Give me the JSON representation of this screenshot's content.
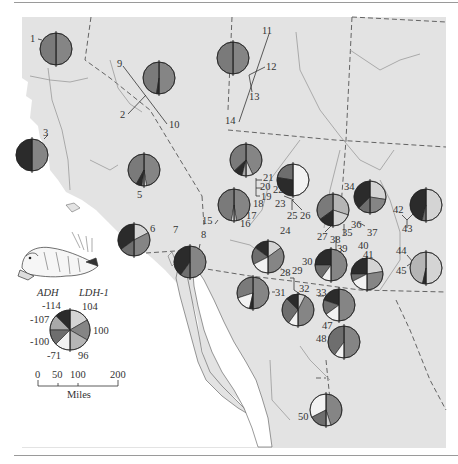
{
  "figure": {
    "type": "allele-frequency pie map",
    "background_land": "#e3e3e3",
    "background_sea": "#ffffff",
    "border_color": "#555555",
    "river_color": "#9a9a9a"
  },
  "legend": {
    "left_header": "ADH",
    "right_header": "LDH-1",
    "adh_alleles": [
      "-114",
      "-107",
      "-100",
      "-71"
    ],
    "ldh_alleles": [
      "104",
      "100",
      "96"
    ],
    "colors": {
      "adh_-114": "#2b2b2b",
      "adh_-107": "#a9a9a9",
      "adh_-100": "#6e6e6e",
      "adh_-71": "#f2f2f2",
      "ldh_104": "#d4d4d4",
      "ldh_100": "#858585",
      "ldh_96": "#b5b5b5"
    }
  },
  "scale_bar": {
    "ticks": [
      "0",
      "50",
      "100",
      "200"
    ],
    "unit": "Miles"
  },
  "illustration": "pocket gopher drawing",
  "sites": [
    {
      "id": "1",
      "x": 56,
      "y": 48
    },
    {
      "id": "2",
      "x": 124,
      "y": 114
    },
    {
      "id": "3",
      "x": 32,
      "y": 155
    },
    {
      "id": "4",
      "x": 32,
      "y": 155
    },
    {
      "id": "5",
      "x": 144,
      "y": 170
    },
    {
      "id": "6",
      "x": 134,
      "y": 247
    },
    {
      "id": "7",
      "x": 76,
      "y": 258
    },
    {
      "id": "8",
      "x": 191,
      "y": 258
    },
    {
      "id": "9",
      "x": 121,
      "y": 67
    },
    {
      "id": "10",
      "x": 173,
      "y": 124
    },
    {
      "id": "11",
      "x": 264,
      "y": 33
    },
    {
      "id": "12",
      "x": 270,
      "y": 66
    },
    {
      "id": "13",
      "x": 252,
      "y": 97
    },
    {
      "id": "14",
      "x": 233,
      "y": 120
    },
    {
      "id": "15",
      "x": 205,
      "y": 218
    },
    {
      "id": "16",
      "x": 244,
      "y": 226
    },
    {
      "id": "17",
      "x": 251,
      "y": 216
    },
    {
      "id": "18",
      "x": 254,
      "y": 203
    },
    {
      "id": "19",
      "x": 264,
      "y": 197
    },
    {
      "id": "20",
      "x": 264,
      "y": 188
    },
    {
      "id": "21",
      "x": 270,
      "y": 178
    },
    {
      "id": "22",
      "x": 284,
      "y": 192
    },
    {
      "id": "23",
      "x": 283,
      "y": 205
    },
    {
      "id": "24",
      "x": 282,
      "y": 231
    },
    {
      "id": "25",
      "x": 290,
      "y": 215
    },
    {
      "id": "26",
      "x": 306,
      "y": 215
    },
    {
      "id": "27",
      "x": 321,
      "y": 238
    },
    {
      "id": "28",
      "x": 281,
      "y": 272
    },
    {
      "id": "29",
      "x": 296,
      "y": 271
    },
    {
      "id": "30",
      "x": 309,
      "y": 262
    },
    {
      "id": "31",
      "x": 280,
      "y": 291
    },
    {
      "id": "32",
      "x": 301,
      "y": 289
    },
    {
      "id": "33",
      "x": 320,
      "y": 289
    },
    {
      "id": "34",
      "x": 350,
      "y": 187
    },
    {
      "id": "35",
      "x": 347,
      "y": 231
    },
    {
      "id": "36",
      "x": 357,
      "y": 225
    },
    {
      "id": "37",
      "x": 371,
      "y": 232
    },
    {
      "id": "38",
      "x": 332,
      "y": 241
    },
    {
      "id": "39",
      "x": 342,
      "y": 250
    },
    {
      "id": "40",
      "x": 358,
      "y": 246
    },
    {
      "id": "41",
      "x": 364,
      "y": 256
    },
    {
      "id": "42",
      "x": 398,
      "y": 210
    },
    {
      "id": "43",
      "x": 407,
      "y": 228
    },
    {
      "id": "44",
      "x": 402,
      "y": 251
    },
    {
      "id": "45",
      "x": 402,
      "y": 270
    },
    {
      "id": "47",
      "x": 326,
      "y": 328
    },
    {
      "id": "48",
      "x": 320,
      "y": 341
    },
    {
      "id": "50",
      "x": 305,
      "y": 418
    }
  ],
  "pies": [
    {
      "site": "1",
      "cx": 56,
      "cy": 49,
      "r": 16,
      "left": [
        [
          "#7a7a7a",
          1.0
        ]
      ],
      "right": [
        [
          "#858585",
          1.0
        ]
      ]
    },
    {
      "site": "9/10",
      "cx": 159,
      "cy": 78,
      "r": 16,
      "left": [
        [
          "#7a7a7a",
          0.95
        ],
        [
          "#2b2b2b",
          0.05
        ]
      ],
      "right": [
        [
          "#858585",
          1.0
        ]
      ]
    },
    {
      "site": "11-14",
      "cx": 233,
      "cy": 58,
      "r": 16,
      "left": [
        [
          "#7a7a7a",
          1.0
        ]
      ],
      "right": [
        [
          "#858585",
          1.0
        ]
      ]
    },
    {
      "site": "3",
      "cx": 32,
      "cy": 155,
      "r": 16,
      "left": [
        [
          "#2b2b2b",
          1.0
        ]
      ],
      "right": [
        [
          "#858585",
          1.0
        ]
      ]
    },
    {
      "site": "5",
      "cx": 144,
      "cy": 170,
      "r": 16,
      "left": [
        [
          "#7a7a7a",
          0.84
        ],
        [
          "#2b2b2b",
          0.12
        ],
        [
          "#a9a9a9",
          0.04
        ]
      ],
      "right": [
        [
          "#858585",
          0.95
        ],
        [
          "#f2f2f2",
          0.05
        ]
      ]
    },
    {
      "site": "15-17",
      "cx": 234,
      "cy": 205,
      "r": 16,
      "left": [
        [
          "#7a7a7a",
          0.95
        ],
        [
          "#f2f2f2",
          0.05
        ]
      ],
      "right": [
        [
          "#858585",
          0.95
        ],
        [
          "#d4d4d4",
          0.05
        ]
      ]
    },
    {
      "site": "18-21",
      "cx": 246,
      "cy": 160,
      "r": 16,
      "left": [
        [
          "#7a7a7a",
          0.74
        ],
        [
          "#2b2b2b",
          0.18
        ],
        [
          "#a9a9a9",
          0.08
        ]
      ],
      "right": [
        [
          "#858585",
          0.86
        ],
        [
          "#d4d4d4",
          0.14
        ]
      ]
    },
    {
      "site": "22-26",
      "cx": 293,
      "cy": 180,
      "r": 16,
      "left": [
        [
          "#6e6e6e",
          0.45
        ],
        [
          "#2b2b2b",
          0.55
        ]
      ],
      "right": [
        [
          "#f2f2f2",
          1.0
        ]
      ]
    },
    {
      "site": "6",
      "cx": 134,
      "cy": 240,
      "r": 16,
      "left": [
        [
          "#2b2b2b",
          0.7
        ],
        [
          "#6e6e6e",
          0.3
        ]
      ],
      "right": [
        [
          "#d4d4d4",
          0.35
        ],
        [
          "#858585",
          0.65
        ]
      ]
    },
    {
      "site": "8",
      "cx": 190,
      "cy": 262,
      "r": 16,
      "left": [
        [
          "#2b2b2b",
          0.8
        ],
        [
          "#6e6e6e",
          0.2
        ]
      ],
      "right": [
        [
          "#858585",
          1.0
        ]
      ]
    },
    {
      "site": "24",
      "cx": 268,
      "cy": 257,
      "r": 16,
      "left": [
        [
          "#2b2b2b",
          0.3
        ],
        [
          "#6e6e6e",
          0.35
        ],
        [
          "#f2f2f2",
          0.35
        ]
      ],
      "right": [
        [
          "#d4d4d4",
          0.3
        ],
        [
          "#858585",
          0.7
        ]
      ]
    },
    {
      "site": "27/35",
      "cx": 333,
      "cy": 210,
      "r": 16,
      "left": [
        [
          "#7a7a7a",
          0.7
        ],
        [
          "#2b2b2b",
          0.3
        ]
      ],
      "right": [
        [
          "#b5b5b5",
          0.6
        ],
        [
          "#d4d4d4",
          0.4
        ]
      ]
    },
    {
      "site": "34/36/37",
      "cx": 370,
      "cy": 197,
      "r": 16,
      "left": [
        [
          "#2b2b2b",
          0.75
        ],
        [
          "#6e6e6e",
          0.25
        ]
      ],
      "right": [
        [
          "#d4d4d4",
          0.55
        ],
        [
          "#858585",
          0.45
        ]
      ]
    },
    {
      "site": "42/43",
      "cx": 426,
      "cy": 205,
      "r": 16,
      "left": [
        [
          "#2b2b2b",
          0.92
        ],
        [
          "#6e6e6e",
          0.08
        ]
      ],
      "right": [
        [
          "#d4d4d4",
          1.0
        ]
      ]
    },
    {
      "site": "30/38/39",
      "cx": 331,
      "cy": 265,
      "r": 16,
      "left": [
        [
          "#2b2b2b",
          0.5
        ],
        [
          "#6e6e6e",
          0.3
        ],
        [
          "#f2f2f2",
          0.2
        ]
      ],
      "right": [
        [
          "#858585",
          1.0
        ]
      ]
    },
    {
      "site": "40/41",
      "cx": 367,
      "cy": 274,
      "r": 16,
      "left": [
        [
          "#2b2b2b",
          0.5
        ],
        [
          "#6e6e6e",
          0.15
        ],
        [
          "#f2f2f2",
          0.35
        ]
      ],
      "right": [
        [
          "#d4d4d4",
          0.45
        ],
        [
          "#858585",
          0.55
        ]
      ]
    },
    {
      "site": "44/45",
      "cx": 426,
      "cy": 268,
      "r": 16,
      "left": [
        [
          "#b5b5b5",
          0.93
        ],
        [
          "#2b2b2b",
          0.07
        ]
      ],
      "right": [
        [
          "#d4d4d4",
          1.0
        ]
      ]
    },
    {
      "site": "31",
      "cx": 253,
      "cy": 293,
      "r": 16,
      "left": [
        [
          "#7a7a7a",
          0.6
        ],
        [
          "#f2f2f2",
          0.33
        ],
        [
          "#2b2b2b",
          0.07
        ]
      ],
      "right": [
        [
          "#858585",
          1.0
        ]
      ]
    },
    {
      "site": "28/29/32",
      "cx": 298,
      "cy": 310,
      "r": 16,
      "left": [
        [
          "#2b2b2b",
          0.25
        ],
        [
          "#6e6e6e",
          0.55
        ],
        [
          "#f2f2f2",
          0.2
        ]
      ],
      "right": [
        [
          "#d4d4d4",
          0.15
        ],
        [
          "#858585",
          0.85
        ]
      ]
    },
    {
      "site": "33",
      "cx": 339,
      "cy": 305,
      "r": 16,
      "left": [
        [
          "#2b2b2b",
          0.4
        ],
        [
          "#6e6e6e",
          0.3
        ],
        [
          "#f2f2f2",
          0.3
        ]
      ],
      "right": [
        [
          "#858585",
          1.0
        ]
      ]
    },
    {
      "site": "47/48",
      "cx": 344,
      "cy": 342,
      "r": 16,
      "left": [
        [
          "#6e6e6e",
          0.8
        ],
        [
          "#f2f2f2",
          0.2
        ]
      ],
      "right": [
        [
          "#858585",
          1.0
        ]
      ]
    },
    {
      "site": "50",
      "cx": 326,
      "cy": 410,
      "r": 16,
      "left": [
        [
          "#f2f2f2",
          0.65
        ],
        [
          "#6e6e6e",
          0.35
        ]
      ],
      "right": [
        [
          "#858585",
          0.9
        ],
        [
          "#d4d4d4",
          0.1
        ]
      ]
    }
  ]
}
